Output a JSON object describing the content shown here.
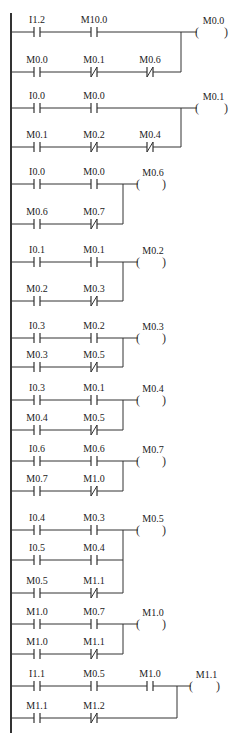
{
  "diagram": {
    "type": "ladder-logic",
    "rail": {
      "x": 11,
      "y_top": 13,
      "y_bottom": 733
    },
    "rungs": [
      {
        "coil": "M0.0",
        "wide": true,
        "rows": [
          {
            "y": 32,
            "contacts": [
              {
                "tag": "I1.2",
                "type": "NO"
              },
              {
                "tag": "M10.0",
                "type": "NO"
              }
            ]
          },
          {
            "y": 72,
            "contacts": [
              {
                "tag": "M0.0",
                "type": "NO"
              },
              {
                "tag": "M0.1",
                "type": "NC"
              },
              {
                "tag": "M0.6",
                "type": "NC"
              }
            ]
          }
        ]
      },
      {
        "coil": "M0.1",
        "wide": true,
        "rows": [
          {
            "y": 108,
            "contacts": [
              {
                "tag": "I0.0",
                "type": "NO"
              },
              {
                "tag": "M0.0",
                "type": "NO"
              }
            ]
          },
          {
            "y": 147,
            "contacts": [
              {
                "tag": "M0.1",
                "type": "NO"
              },
              {
                "tag": "M0.2",
                "type": "NC"
              },
              {
                "tag": "M0.4",
                "type": "NC"
              }
            ]
          }
        ]
      },
      {
        "coil": "M0.6",
        "wide": false,
        "rows": [
          {
            "y": 184,
            "contacts": [
              {
                "tag": "I0.0",
                "type": "NO"
              },
              {
                "tag": "M0.0",
                "type": "NO"
              }
            ]
          },
          {
            "y": 224,
            "contacts": [
              {
                "tag": "M0.6",
                "type": "NO"
              },
              {
                "tag": "M0.7",
                "type": "NC"
              }
            ]
          }
        ]
      },
      {
        "coil": "M0.2",
        "wide": false,
        "rows": [
          {
            "y": 262,
            "contacts": [
              {
                "tag": "I0.1",
                "type": "NO"
              },
              {
                "tag": "M0.1",
                "type": "NO"
              }
            ]
          },
          {
            "y": 301,
            "contacts": [
              {
                "tag": "M0.2",
                "type": "NO"
              },
              {
                "tag": "M0.3",
                "type": "NC"
              }
            ]
          }
        ]
      },
      {
        "coil": "M0.3",
        "wide": false,
        "rows": [
          {
            "y": 338,
            "contacts": [
              {
                "tag": "I0.3",
                "type": "NO"
              },
              {
                "tag": "M0.2",
                "type": "NO"
              }
            ]
          },
          {
            "y": 367,
            "contacts": [
              {
                "tag": "M0.3",
                "type": "NO"
              },
              {
                "tag": "M0.5",
                "type": "NC"
              }
            ]
          }
        ]
      },
      {
        "coil": "M0.4",
        "wide": false,
        "rows": [
          {
            "y": 400,
            "contacts": [
              {
                "tag": "I0.3",
                "type": "NO"
              },
              {
                "tag": "M0.1",
                "type": "NO"
              }
            ]
          },
          {
            "y": 430,
            "contacts": [
              {
                "tag": "M0.4",
                "type": "NO"
              },
              {
                "tag": "M0.5",
                "type": "NC"
              }
            ]
          }
        ]
      },
      {
        "coil": "M0.7",
        "wide": false,
        "rows": [
          {
            "y": 461,
            "contacts": [
              {
                "tag": "I0.6",
                "type": "NO"
              },
              {
                "tag": "M0.6",
                "type": "NO"
              }
            ]
          },
          {
            "y": 491,
            "contacts": [
              {
                "tag": "M0.7",
                "type": "NO"
              },
              {
                "tag": "M1.0",
                "type": "NC"
              }
            ]
          }
        ]
      },
      {
        "coil": "M0.5",
        "wide": false,
        "rows": [
          {
            "y": 530,
            "contacts": [
              {
                "tag": "I0.4",
                "type": "NO"
              },
              {
                "tag": "M0.3",
                "type": "NO"
              }
            ]
          },
          {
            "y": 560,
            "contacts": [
              {
                "tag": "I0.5",
                "type": "NO"
              },
              {
                "tag": "M0.4",
                "type": "NO"
              }
            ]
          },
          {
            "y": 593,
            "contacts": [
              {
                "tag": "M0.5",
                "type": "NO"
              },
              {
                "tag": "M1.1",
                "type": "NC"
              }
            ]
          }
        ]
      },
      {
        "coil": "M1.0",
        "wide": false,
        "rows": [
          {
            "y": 624,
            "contacts": [
              {
                "tag": "M1.0",
                "type": "NO"
              },
              {
                "tag": "M0.7",
                "type": "NO"
              }
            ]
          },
          {
            "y": 654,
            "contacts": [
              {
                "tag": "M1.0",
                "type": "NO"
              },
              {
                "tag": "M1.1",
                "type": "NC"
              }
            ]
          }
        ]
      },
      {
        "coil": "M1.1",
        "wide": "last",
        "rows": [
          {
            "y": 686,
            "contacts": [
              {
                "tag": "I1.1",
                "type": "NO"
              },
              {
                "tag": "M0.5",
                "type": "NO"
              },
              {
                "tag": "M1.0",
                "type": "NO"
              }
            ]
          },
          {
            "y": 718,
            "contacts": [
              {
                "tag": "M1.1",
                "type": "NO"
              },
              {
                "tag": "M1.2",
                "type": "NC"
              }
            ]
          }
        ]
      }
    ]
  }
}
